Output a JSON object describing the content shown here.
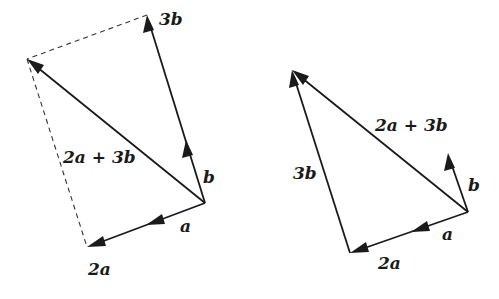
{
  "diagram": {
    "left": {
      "title": "parallelogram-construction",
      "labels": {
        "three_b": "3b",
        "sum": "2a + 3b",
        "b": "b",
        "a": "a",
        "two_a": "2a"
      }
    },
    "right": {
      "title": "triangle-construction",
      "labels": {
        "sum": "2a + 3b",
        "three_b": "3b",
        "b": "b",
        "a": "a",
        "two_a": "2a"
      }
    },
    "colors": {
      "ink": "#1a1a1a",
      "background": "#ffffff"
    }
  }
}
